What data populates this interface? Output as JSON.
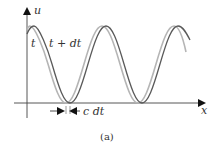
{
  "figure": {
    "caption": "(a)",
    "axes": {
      "y_label": "u",
      "x_label": "x"
    },
    "curves": [
      {
        "name": "wave-at-t",
        "label": "t",
        "color": "#b0b0b0"
      },
      {
        "name": "wave-at-t-plus-dt",
        "label": "t + dt",
        "color": "#555555"
      }
    ],
    "displacement": {
      "label": "c dt"
    }
  }
}
